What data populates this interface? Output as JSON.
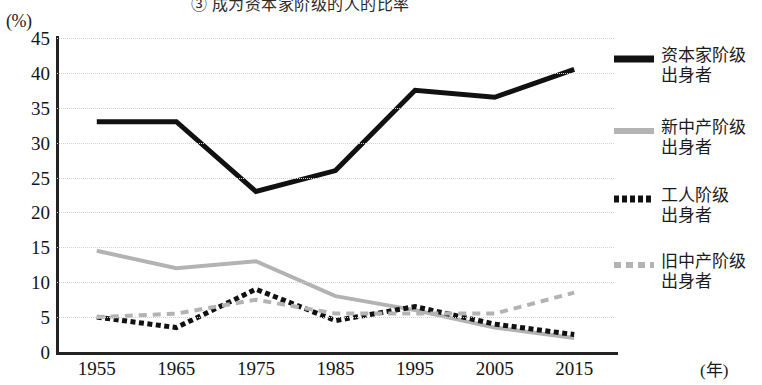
{
  "title": "③ 成为资本家阶级的人的比率",
  "axes": {
    "y_unit": "(%)",
    "x_unit": "(年)",
    "y_ticks": [
      "45",
      "40",
      "35",
      "30",
      "25",
      "20",
      "15",
      "10",
      "5",
      "0"
    ],
    "x_ticks": [
      "1955",
      "1965",
      "1975",
      "1985",
      "1995",
      "2005",
      "2015"
    ]
  },
  "legend": {
    "items": [
      {
        "label": "资本家阶级\n出身者",
        "swatch": "solid-black-line-swatch",
        "color": "#111111"
      },
      {
        "label": "新中产阶级\n出身者",
        "swatch": "solid-gray-line-swatch",
        "color": "#b3b3b3"
      },
      {
        "label": "工人阶级\n出身者",
        "swatch": "dotted-black-line-swatch",
        "color": "#111111"
      },
      {
        "label": "旧中产阶级\n出身者",
        "swatch": "dashed-gray-line-swatch",
        "color": "#b3b3b3"
      }
    ]
  },
  "chart_data": {
    "type": "line",
    "title": "③ 成为资本家阶级的人的比率",
    "xlabel": "(年)",
    "ylabel": "(%)",
    "x": [
      "1955",
      "1965",
      "1975",
      "1985",
      "1995",
      "2005",
      "2015"
    ],
    "ylim": [
      0,
      45
    ],
    "ytick_step": 5,
    "grid": true,
    "legend_position": "right",
    "series": [
      {
        "name": "资本家阶级出身者",
        "style": "solid",
        "color": "#111111",
        "width": 5,
        "values": [
          33.0,
          33.0,
          23.0,
          26.0,
          37.5,
          36.5,
          40.5
        ]
      },
      {
        "name": "新中产阶级出身者",
        "style": "solid",
        "color": "#b3b3b3",
        "width": 4,
        "values": [
          14.5,
          12.0,
          13.0,
          8.0,
          6.0,
          3.5,
          2.0
        ]
      },
      {
        "name": "工人阶级出身者",
        "style": "dotted",
        "color": "#111111",
        "width": 5,
        "values": [
          5.0,
          3.5,
          9.0,
          4.5,
          6.5,
          4.0,
          2.5
        ]
      },
      {
        "name": "旧中产阶级出身者",
        "style": "dashed",
        "color": "#b3b3b3",
        "width": 4,
        "values": [
          5.0,
          5.5,
          7.5,
          5.5,
          5.5,
          5.5,
          8.5
        ]
      }
    ]
  }
}
